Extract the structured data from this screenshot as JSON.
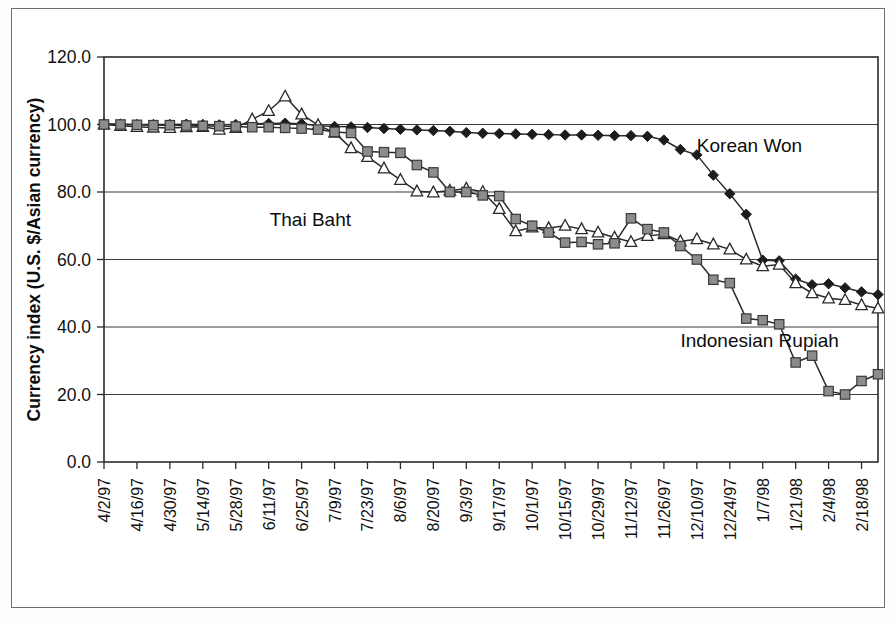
{
  "figure": {
    "name": "asian-currency-index-chart",
    "background_color": "#ffffff",
    "frame_color": "#6e6e6e"
  },
  "chart_data": {
    "type": "line",
    "title": "",
    "subtitle": "",
    "xlabel": "",
    "ylabel": "Currency index (U.S. $/Asian currency)",
    "ylim": [
      0,
      120
    ],
    "yticks": [
      "0.0",
      "20.0",
      "40.0",
      "60.0",
      "80.0",
      "100.0",
      "120.0"
    ],
    "ytick_values": [
      0,
      20,
      40,
      60,
      80,
      100,
      120
    ],
    "grid": true,
    "grid_axis": "y",
    "legend_position": "inline-annotations",
    "x": [
      "4/2/97",
      "4/9/97",
      "4/16/97",
      "4/23/97",
      "4/30/97",
      "5/7/97",
      "5/14/97",
      "5/21/97",
      "5/28/97",
      "6/4/97",
      "6/11/97",
      "6/18/97",
      "6/25/97",
      "7/2/97",
      "7/9/97",
      "7/16/97",
      "7/23/97",
      "7/30/97",
      "8/6/97",
      "8/13/97",
      "8/20/97",
      "8/27/97",
      "9/3/97",
      "9/10/97",
      "9/17/97",
      "9/24/97",
      "10/1/97",
      "10/8/97",
      "10/15/97",
      "10/22/97",
      "10/29/97",
      "11/5/97",
      "11/12/97",
      "11/19/97",
      "11/26/97",
      "12/3/97",
      "12/10/97",
      "12/17/97",
      "12/24/97",
      "12/31/97",
      "1/7/98",
      "1/14/98",
      "1/21/98",
      "1/28/98",
      "2/4/98",
      "2/11/98",
      "2/18/98",
      "2/25/98"
    ],
    "xtick_labels": [
      "4/2/97",
      "4/16/97",
      "4/30/97",
      "5/14/97",
      "5/28/97",
      "6/11/97",
      "6/25/97",
      "7/9/97",
      "7/23/97",
      "8/6/97",
      "8/20/97",
      "9/3/97",
      "9/17/97",
      "10/1/97",
      "10/15/97",
      "10/29/97",
      "11/12/97",
      "11/26/97",
      "12/10/97",
      "12/24/97",
      "1/7/98",
      "1/21/98",
      "2/4/98",
      "2/18/98"
    ],
    "xtick_stride": 2,
    "series": [
      {
        "name": "Korean Won",
        "label": "Korean Won",
        "marker": "diamond-filled",
        "marker_color": "#1c1c1c",
        "line_color": "#2a2a2a",
        "label_x_index": 36,
        "label_y_value": 92,
        "values": [
          100.2,
          100.1,
          100.0,
          100.0,
          100.0,
          100.1,
          100.0,
          99.9,
          100.0,
          100.2,
          100.3,
          100.4,
          100.2,
          99.6,
          99.4,
          99.3,
          99.1,
          98.8,
          98.6,
          98.4,
          98.2,
          98.0,
          97.6,
          97.4,
          97.3,
          97.2,
          97.1,
          97.0,
          96.9,
          96.9,
          96.8,
          96.7,
          96.7,
          96.5,
          95.4,
          92.6,
          91.0,
          85.0,
          79.5,
          73.4,
          59.8,
          59.6,
          54.2,
          52.5,
          52.8,
          51.6,
          50.4,
          49.6
        ],
        "values_tail": [
          51.0,
          51.2,
          50.8,
          52.4,
          54.0,
          53.0,
          52.4
        ]
      },
      {
        "name": "Thai Baht",
        "label": "Thai Baht",
        "marker": "triangle-open",
        "marker_color": "#ffffff",
        "line_color": "#2a2a2a",
        "label_x_index": 15,
        "label_y_value": 70,
        "values": [
          100.0,
          99.6,
          99.3,
          99.1,
          99.0,
          99.2,
          99.3,
          98.5,
          99.0,
          101.5,
          104.0,
          108.3,
          103.0,
          99.8,
          97.6,
          93.0,
          90.4,
          87.0,
          83.6,
          80.2,
          79.9,
          80.4,
          81.0,
          80.0,
          75.0,
          68.4,
          69.5,
          69.3,
          70.0,
          69.0,
          68.0,
          66.5,
          65.2,
          67.0,
          67.5,
          65.4,
          66.0,
          64.5,
          63.0,
          60.0,
          58.0,
          58.5,
          53.0,
          50.0,
          48.5,
          48.0,
          46.5,
          45.5
        ]
      },
      {
        "name": "Indonesian Rupiah",
        "label": "Indonesian Rupiah",
        "marker": "square-filled",
        "marker_color": "#8c8c8c",
        "line_color": "#2a2a2a",
        "label_x_index": 35,
        "label_y_value": 34,
        "values": [
          100.0,
          100.0,
          99.9,
          99.8,
          99.8,
          99.7,
          99.6,
          99.5,
          99.4,
          99.2,
          99.2,
          99.0,
          98.8,
          98.5,
          97.8,
          97.5,
          92.0,
          91.8,
          91.6,
          88.0,
          85.8,
          80.0,
          80.0,
          79.0,
          78.8,
          72.0,
          70.0,
          68.0,
          65.0,
          65.2,
          64.5,
          64.8,
          72.2,
          69.0,
          68.0,
          64.0,
          60.0,
          54.0,
          53.0,
          42.5,
          42.0,
          40.8,
          29.5,
          31.5,
          21.0,
          20.0,
          24.0,
          26.0
        ]
      }
    ]
  }
}
